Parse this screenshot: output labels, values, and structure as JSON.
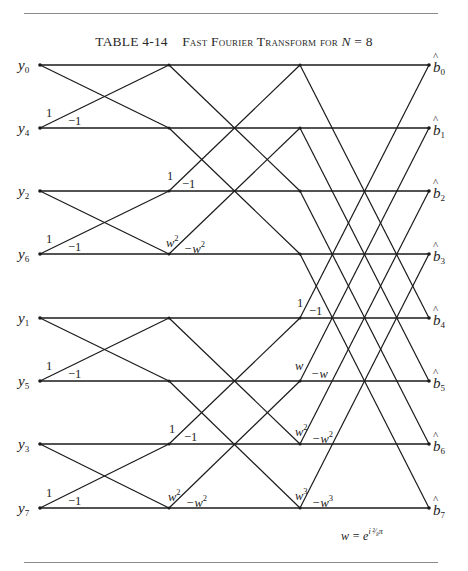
{
  "caption": {
    "table_no": "TABLE 4-14",
    "title_sc": "Fast Fourier Transform for",
    "var": "N",
    "eq": " = 8"
  },
  "inputs": [
    "y",
    "y",
    "y",
    "y",
    "y",
    "y",
    "y",
    "y"
  ],
  "input_indices": [
    "0",
    "4",
    "2",
    "6",
    "1",
    "5",
    "3",
    "7"
  ],
  "outputs": [
    "b",
    "b",
    "b",
    "b",
    "b",
    "b",
    "b",
    "b"
  ],
  "output_indices": [
    "0",
    "1",
    "2",
    "3",
    "4",
    "5",
    "6",
    "7"
  ],
  "stage1_weights": {
    "plus": "1",
    "minus": "−1"
  },
  "stage2_weights": [
    {
      "plus": "1",
      "minus": "−1",
      "exp": ""
    },
    {
      "plus": "w",
      "minus": "−w",
      "exp": "2"
    },
    {
      "plus": "1",
      "minus": "−1",
      "exp": ""
    },
    {
      "plus": "w",
      "minus": "−w",
      "exp": "2"
    }
  ],
  "stage3_weights": [
    {
      "plus": "1",
      "minus": "−1",
      "exp": ""
    },
    {
      "plus": "w",
      "minus": "−w",
      "exp": ""
    },
    {
      "plus": "w",
      "minus": "−w",
      "exp": "2"
    },
    {
      "plus": "w",
      "minus": "−w",
      "exp": "3"
    }
  ],
  "formula": {
    "lhs": "w = e",
    "exp": "i ²⁄₈π"
  },
  "diagram": {
    "columns_x": [
      40,
      169,
      300,
      429
    ],
    "rows_y": [
      65,
      128,
      191,
      254,
      318,
      381,
      444,
      508
    ],
    "line_color": "#1a1a1a"
  }
}
